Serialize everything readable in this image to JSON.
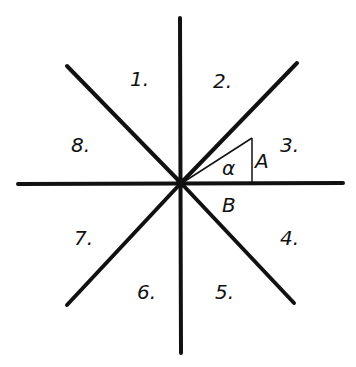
{
  "diagram": {
    "sectors": [
      {
        "label": "1.",
        "x": 122,
        "y": 84
      },
      {
        "label": "2.",
        "x": 205,
        "y": 86
      },
      {
        "label": "3.",
        "x": 276,
        "y": 149
      },
      {
        "label": "4.",
        "x": 276,
        "y": 243
      },
      {
        "label": "5.",
        "x": 208,
        "y": 297
      },
      {
        "label": "6.",
        "x": 133,
        "y": 297
      },
      {
        "label": "7.",
        "x": 71,
        "y": 243
      },
      {
        "label": "8.",
        "x": 69,
        "y": 149
      }
    ],
    "triangle_labels": {
      "angle": "α",
      "opposite": "A",
      "adjacent": "B"
    },
    "colors": {
      "ink": "#111111",
      "background": "#ffffff"
    }
  }
}
